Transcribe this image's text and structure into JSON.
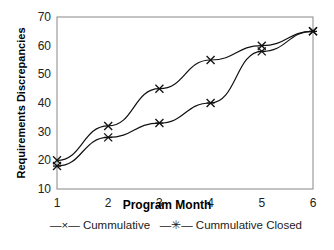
{
  "chart_data": {
    "type": "line",
    "title": "",
    "xlabel": "Program Month",
    "ylabel": "Requirements Discrepancies",
    "x": [
      1,
      2,
      3,
      4,
      5,
      6
    ],
    "ylim": [
      10,
      70
    ],
    "yticks": [
      10,
      20,
      30,
      40,
      50,
      60,
      70
    ],
    "grid": false,
    "legend_position": "bottom",
    "series": [
      {
        "name": "Cummulative",
        "marker": "x",
        "values": [
          20,
          32,
          45,
          55,
          60,
          65
        ]
      },
      {
        "name": "Cummulative Closed",
        "marker": "asterisk",
        "values": [
          18,
          28,
          33,
          40,
          58,
          65
        ]
      }
    ]
  },
  "labels": {
    "xlabel": "Program Month",
    "ylabel": "Requirements Discrepancies",
    "legend_1": "Cummulative",
    "legend_2": "Cummulative Closed",
    "legend_1_glyph": "—×—",
    "legend_2_glyph": "—✳—"
  }
}
